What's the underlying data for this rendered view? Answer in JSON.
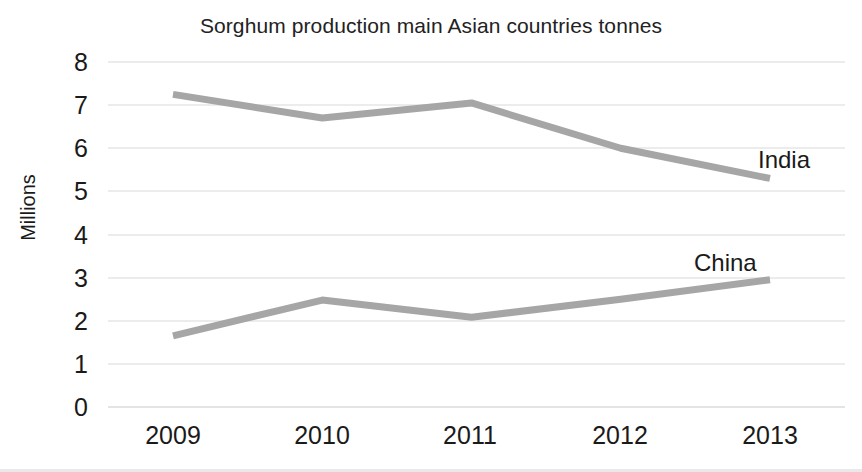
{
  "chart_data": {
    "type": "line",
    "title": "Sorghum production main Asian countries tonnes",
    "xlabel": "",
    "ylabel": "Millions",
    "categories": [
      "2009",
      "2010",
      "2011",
      "2012",
      "2013"
    ],
    "ylim": [
      0,
      8
    ],
    "ytick_labels": [
      "0",
      "1",
      "2",
      "3",
      "4",
      "5",
      "6",
      "7",
      "8"
    ],
    "grid": true,
    "grid_axis": "y",
    "legend_position": "inline-end-of-line",
    "series": [
      {
        "name": "India",
        "values": [
          7.25,
          6.7,
          7.05,
          6.0,
          5.3
        ],
        "color": "#a6a6a6",
        "label_text": "India"
      },
      {
        "name": "China",
        "values": [
          1.65,
          2.48,
          2.08,
          2.5,
          2.95
        ],
        "color": "#a6a6a6",
        "label_text": "China"
      }
    ]
  },
  "axis": {
    "y_ticks": [
      {
        "label": "8",
        "value": 8
      },
      {
        "label": "7",
        "value": 7
      },
      {
        "label": "6",
        "value": 6
      },
      {
        "label": "5",
        "value": 5
      },
      {
        "label": "4",
        "value": 4
      },
      {
        "label": "3",
        "value": 3
      },
      {
        "label": "2",
        "value": 2
      },
      {
        "label": "1",
        "value": 1
      },
      {
        "label": "0",
        "value": 0
      }
    ],
    "y_title": "Millions",
    "x_ticks": [
      {
        "label": "2009"
      },
      {
        "label": "2010"
      },
      {
        "label": "2011"
      },
      {
        "label": "2012"
      },
      {
        "label": "2013"
      }
    ]
  },
  "labels": {
    "india": "India",
    "china": "China"
  },
  "colors": {
    "line": "#a6a6a6",
    "grid": "#eceaea",
    "text": "#1a1a1a",
    "background": "#ffffff"
  }
}
